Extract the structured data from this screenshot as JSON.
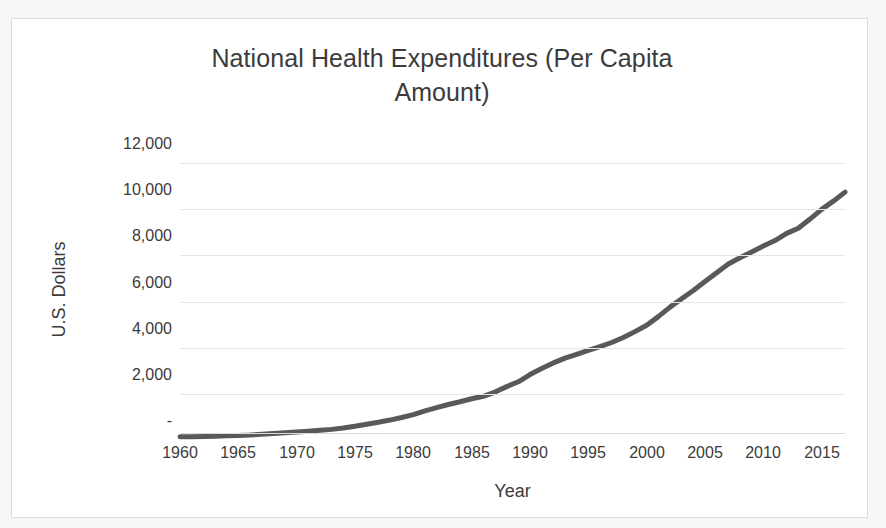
{
  "chart_data": {
    "type": "line",
    "title": "National Health Expenditures (Per Capita Amount)",
    "title_line1": "National Health Expenditures (Per Capita",
    "title_line2": "Amount)",
    "xlabel": "Year",
    "ylabel": "U.S. Dollars",
    "xlim": [
      1960,
      2017
    ],
    "ylim": [
      0,
      12000
    ],
    "ytick_labels": [
      "12,000",
      "10,000",
      "8,000",
      "6,000",
      "4,000",
      "2,000",
      "-"
    ],
    "ytick_values": [
      12000,
      10000,
      8000,
      6000,
      4000,
      2000,
      0
    ],
    "xtick_labels": [
      "1960",
      "1965",
      "1970",
      "1975",
      "1980",
      "1985",
      "1990",
      "1995",
      "2000",
      "2005",
      "2010",
      "2015"
    ],
    "xtick_values": [
      1960,
      1965,
      1970,
      1975,
      1980,
      1985,
      1990,
      1995,
      2000,
      2005,
      2010,
      2015
    ],
    "grid": "horizontal",
    "legend": "none",
    "markers": "none",
    "series_name": "National Health Expenditures per capita",
    "line_color": "#595959",
    "line_width": 5,
    "grid_color": "#e4e4e4",
    "text_color": "#3b3b3b",
    "frame_color": "#dcdcdc",
    "x": [
      1960,
      1961,
      1962,
      1963,
      1964,
      1965,
      1966,
      1967,
      1968,
      1969,
      1970,
      1971,
      1972,
      1973,
      1974,
      1975,
      1976,
      1977,
      1978,
      1979,
      1980,
      1981,
      1982,
      1983,
      1984,
      1985,
      1986,
      1987,
      1988,
      1989,
      1990,
      1991,
      1992,
      1993,
      1994,
      1995,
      1996,
      1997,
      1998,
      1999,
      2000,
      2001,
      2002,
      2003,
      2004,
      2005,
      2006,
      2007,
      2008,
      2009,
      2010,
      2011,
      2012,
      2013,
      2014,
      2015,
      2016,
      2017
    ],
    "y": [
      146,
      153,
      164,
      176,
      193,
      205,
      224,
      254,
      285,
      318,
      355,
      391,
      429,
      469,
      528,
      605,
      687,
      779,
      871,
      983,
      1110,
      1270,
      1414,
      1547,
      1664,
      1794,
      1901,
      2085,
      2319,
      2529,
      2843,
      3103,
      3347,
      3553,
      3720,
      3885,
      4054,
      4230,
      4443,
      4700,
      4976,
      5350,
      5760,
      6121,
      6478,
      6869,
      7250,
      7628,
      7897,
      8151,
      8404,
      8641,
      8954,
      9175,
      9573,
      9994,
      10348,
      10739
    ]
  }
}
